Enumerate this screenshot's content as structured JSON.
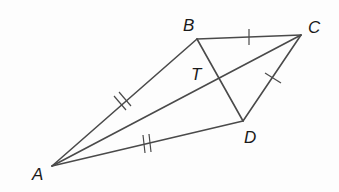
{
  "diagram": {
    "type": "geometry-kite",
    "colors": {
      "line": "#4a4a4a",
      "label": "#1a1a1a",
      "background": "#fdfdfd"
    },
    "points": {
      "A": {
        "label": "A",
        "x": 52,
        "y": 166
      },
      "B": {
        "label": "B",
        "x": 197,
        "y": 39
      },
      "C": {
        "label": "C",
        "x": 301,
        "y": 35
      },
      "D": {
        "label": "D",
        "x": 243,
        "y": 121
      },
      "T": {
        "label": "T",
        "x": 219,
        "y": 80
      }
    },
    "segments": [
      {
        "from": "A",
        "to": "B",
        "marks": 2
      },
      {
        "from": "A",
        "to": "D",
        "marks": 2
      },
      {
        "from": "B",
        "to": "C",
        "marks": 1
      },
      {
        "from": "C",
        "to": "D",
        "marks": 1
      },
      {
        "from": "A",
        "to": "C",
        "marks": 0
      },
      {
        "from": "B",
        "to": "D",
        "marks": 0
      }
    ],
    "labels": {
      "A": "A",
      "B": "B",
      "C": "C",
      "D": "D",
      "T": "T"
    }
  }
}
